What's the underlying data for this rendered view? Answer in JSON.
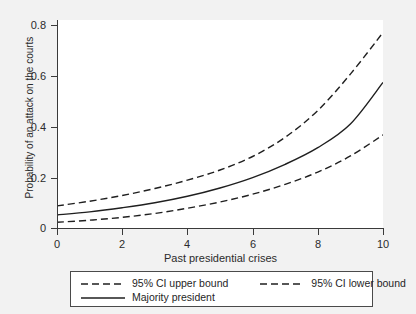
{
  "chart_data": {
    "type": "line",
    "title": "",
    "xlabel": "Past presidential crises",
    "ylabel": "Probability of an attack on the courts",
    "xlim": [
      0,
      10
    ],
    "ylim": [
      0,
      0.8
    ],
    "xticks": [
      "0",
      "2",
      "4",
      "6",
      "8",
      "10"
    ],
    "xtick_values": [
      0,
      2,
      4,
      6,
      8,
      10
    ],
    "yticks": [
      "0",
      "0.2",
      "0.4",
      "0.6",
      "0.8"
    ],
    "ytick_values": [
      0,
      0.2,
      0.4,
      0.6,
      0.8
    ],
    "grid": false,
    "legend_position": "below-axes",
    "x": [
      0,
      1,
      2,
      3,
      4,
      5,
      6,
      7,
      8,
      9,
      10
    ],
    "series": [
      {
        "name": "95% CI upper bound",
        "style": "dashed",
        "color": "#1f1f1f",
        "values": [
          0.085,
          0.103,
          0.125,
          0.152,
          0.184,
          0.223,
          0.275,
          0.349,
          0.452,
          0.592,
          0.752
        ]
      },
      {
        "name": "Majority president",
        "style": "solid",
        "color": "#1f1f1f",
        "values": [
          0.05,
          0.062,
          0.078,
          0.097,
          0.122,
          0.154,
          0.194,
          0.245,
          0.309,
          0.4,
          0.56
        ]
      },
      {
        "name": "95% CI lower bound",
        "style": "dashed",
        "color": "#1f1f1f",
        "values": [
          0.022,
          0.03,
          0.041,
          0.056,
          0.076,
          0.1,
          0.13,
          0.168,
          0.215,
          0.277,
          0.358
        ]
      }
    ]
  },
  "axes": {
    "ylabel": "Probability of an attack on the courts",
    "xlabel": "Past presidential crises",
    "ytick_labels": [
      "0.8",
      "0.6",
      "0.4",
      "0.2",
      "0"
    ],
    "xtick_labels": [
      "0",
      "2",
      "4",
      "6",
      "8",
      "10"
    ]
  },
  "legend": {
    "upper_bound_label": "95% CI upper bound",
    "lower_bound_label": "95% CI lower bound",
    "majority_label": "Majority president"
  },
  "colors": {
    "line": "#1f1f1f",
    "axis": "#3a3a3a",
    "plot_background": "#ffffff",
    "figure_background": "#f2f2f2",
    "legend_border": "#4a4a4a"
  }
}
